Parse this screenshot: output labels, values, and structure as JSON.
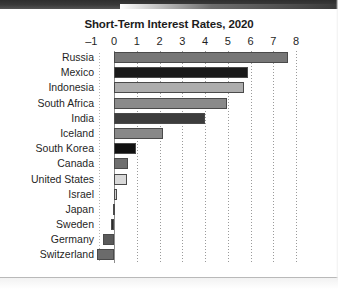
{
  "chart_data": {
    "type": "bar",
    "orientation": "horizontal",
    "title": "Short-Term Interest Rates, 2020",
    "xlabel": "",
    "ylabel": "",
    "xlim": [
      -1,
      8
    ],
    "xticks": [
      -1,
      0,
      1,
      2,
      3,
      4,
      5,
      6,
      7,
      8
    ],
    "xtick_labels": [
      "–1",
      "0",
      "1",
      "2",
      "3",
      "4",
      "5",
      "6",
      "7",
      "8"
    ],
    "grid": "vertical-dotted",
    "legend": "none",
    "categories": [
      "Russia",
      "Mexico",
      "Indonesia",
      "South Africa",
      "India",
      "Iceland",
      "South Korea",
      "Canada",
      "United States",
      "Israel",
      "Japan",
      "Sweden",
      "Germany",
      "Switzerland"
    ],
    "values": [
      7.65,
      5.9,
      5.7,
      4.95,
      4.0,
      2.15,
      0.95,
      0.6,
      0.55,
      0.15,
      -0.05,
      -0.15,
      -0.5,
      -0.75
    ],
    "bar_colors": [
      "#777777",
      "#1a1a1a",
      "#adadad",
      "#8a8a8a",
      "#3d3d3d",
      "#888888",
      "#111111",
      "#6f6f6f",
      "#d8d8d8",
      "#cfcfcf",
      "#bdbdbd",
      "#2b2b2b",
      "#5a5a5a",
      "#6b6b6b"
    ],
    "bar_outline_color": "#4a4a4a"
  },
  "axis": {
    "zero_px": 114,
    "unit_px": 22.75
  }
}
